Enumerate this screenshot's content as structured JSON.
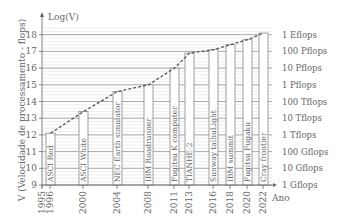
{
  "chart_data": {
    "type": "bar",
    "title": "",
    "xlabel": "Ano",
    "ylabel": "V (Velocidade de processamento - flops)",
    "y_axis_title": "Log(V)",
    "ylim": [
      9,
      18
    ],
    "y_ticks": [
      9,
      10,
      11,
      12,
      13,
      14,
      15,
      16,
      17,
      18
    ],
    "x_ticks": [
      "1995",
      "1996",
      "2000",
      "2004",
      "2008",
      "2011",
      "2013",
      "2016",
      "2018",
      "2020",
      "2022"
    ],
    "grid": true,
    "right_axis_labels": [
      "1 Eflops",
      "100 Pflops",
      "10 Pflops",
      "1 Pflops",
      "100 Tflops",
      "10 Tflops",
      "1 Tflops",
      "100 Gflops",
      "10 Gflops",
      "1 Gflops"
    ],
    "categories": [
      "ASCI Red",
      "ASCI White",
      "NEC Earth simulator",
      "IBM Roadrunner",
      "Fugitsu K computer",
      "TIANHE-2",
      "Sunway taihuLight",
      "IBM summit",
      "Fugitsu Fugaku",
      "Cray frontier"
    ],
    "years": [
      "1996",
      "2000",
      "2004",
      "2008",
      "2011",
      "2013",
      "2016",
      "2018",
      "2020",
      "2022"
    ],
    "values": [
      12.1,
      13.4,
      14.6,
      15.0,
      16.0,
      16.9,
      17.1,
      17.4,
      17.7,
      18.1
    ],
    "trend_line": "dashed"
  },
  "colors": {
    "bar_fill": "#ffffff",
    "bar_stroke": "#888888",
    "grid_major": "#999999",
    "grid_minor": "#dddddd",
    "trend": "#555555",
    "text": "#666666"
  }
}
